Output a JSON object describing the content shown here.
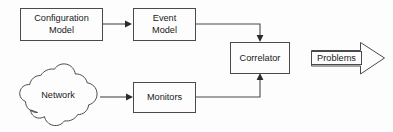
{
  "diagram": {
    "type": "block-flow-diagram",
    "canvas": {
      "width": 393,
      "height": 132,
      "background": "#fdfdfd"
    },
    "colors": {
      "stroke": "#4a4a4a",
      "fill": "#fdfdfd",
      "text": "#1a1a1a",
      "arrowhead": "#2b2b2b"
    },
    "nodes": [
      {
        "id": "configuration-model",
        "shape": "rectangle",
        "label_line1": "Configuration",
        "label_line2": "Model",
        "x": 20,
        "y": 8,
        "width": 82,
        "height": 32
      },
      {
        "id": "event-model",
        "shape": "rectangle",
        "label_line1": "Event",
        "label_line2": "Model",
        "x": 133,
        "y": 8,
        "width": 63,
        "height": 32
      },
      {
        "id": "correlator",
        "shape": "rectangle",
        "label_line1": "Correlator",
        "label_line2": "",
        "x": 230,
        "y": 42,
        "width": 60,
        "height": 31
      },
      {
        "id": "network",
        "shape": "cloud",
        "label_line1": "Network",
        "label_line2": "",
        "x": 20,
        "y": 77,
        "width": 80,
        "height": 47
      },
      {
        "id": "monitors",
        "shape": "rectangle",
        "label_line1": "Monitors",
        "label_line2": "",
        "x": 133,
        "y": 82,
        "width": 63,
        "height": 30
      },
      {
        "id": "problems",
        "shape": "block-arrow-right",
        "label_line1": "Problems",
        "label_line2": "",
        "x": 310,
        "y": 42,
        "width": 75,
        "height": 33
      }
    ],
    "edges": [
      {
        "id": "edge-configuration-model-to-event-model",
        "from": "configuration-model",
        "to": "event-model",
        "path": "M 102 24 L 127 24",
        "arrowhead": "128,24",
        "arrow_direction": "right"
      },
      {
        "id": "edge-event-model-to-correlator",
        "from": "event-model",
        "to": "correlator",
        "path": "M 196 24 L 260 24 L 260 37",
        "arrowhead": "260,41",
        "arrow_direction": "down"
      },
      {
        "id": "edge-network-to-monitors",
        "from": "network",
        "to": "monitors",
        "path": "M 100 97 L 128 97",
        "arrowhead": "129,97",
        "arrow_direction": "right"
      },
      {
        "id": "edge-monitors-to-correlator",
        "from": "monitors",
        "to": "correlator",
        "path": "M 196 97 L 260 97 L 260 78",
        "arrowhead": "260,74",
        "arrow_direction": "up"
      }
    ]
  }
}
